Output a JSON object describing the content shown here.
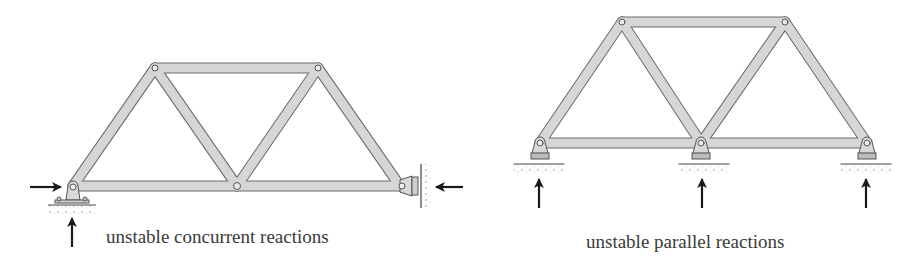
{
  "diagrams": [
    {
      "id": "left",
      "caption": "unstable concurrent reactions",
      "support_left": "pin",
      "support_right": "pin (wall)",
      "reactions": [
        "horizontal arrow right at left support",
        "vertical arrow up at left support",
        "horizontal arrow left at right wall support"
      ]
    },
    {
      "id": "right",
      "caption": "unstable parallel reactions",
      "supports": [
        "roller",
        "roller",
        "roller"
      ],
      "reactions": [
        "vertical arrow up",
        "vertical arrow up",
        "vertical arrow up"
      ]
    }
  ],
  "colors": {
    "member_fill": "#d9d9d9",
    "member_stroke": "#6a6a6a",
    "arrow": "#1a1a1a",
    "text": "#3a3a3a"
  }
}
